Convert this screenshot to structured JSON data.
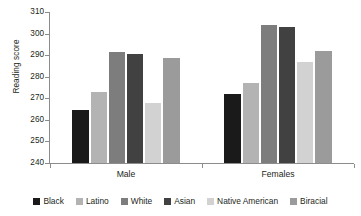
{
  "chart_data": {
    "type": "bar",
    "title": "",
    "xlabel": "",
    "ylabel": "Reading score",
    "categories": [
      "Male",
      "Females"
    ],
    "ylim": [
      240,
      310
    ],
    "yticks": [
      240,
      250,
      260,
      270,
      280,
      290,
      300,
      310
    ],
    "ytick_labels": [
      "240",
      "250",
      "260",
      "270",
      "280",
      "290",
      "300",
      "310"
    ],
    "grid": false,
    "legend_position": "bottom",
    "series": [
      {
        "name": "Black",
        "color": "#1a1a1a",
        "values": [
          264.5,
          272.0
        ]
      },
      {
        "name": "Latino",
        "color": "#b3b3b3",
        "values": [
          273.0,
          277.0
        ]
      },
      {
        "name": "White",
        "color": "#7d7d7d",
        "values": [
          291.5,
          304.0
        ]
      },
      {
        "name": "Asian",
        "color": "#414141",
        "values": [
          290.5,
          303.0
        ]
      },
      {
        "name": "Native American",
        "color": "#d2d2d2",
        "values": [
          268.0,
          287.0
        ]
      },
      {
        "name": "Biracial",
        "color": "#9b9b9b",
        "values": [
          288.5,
          292.0
        ]
      }
    ]
  }
}
